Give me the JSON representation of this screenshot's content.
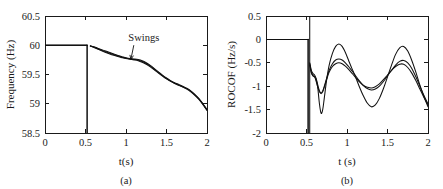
{
  "figure": {
    "background_color": "#ffffff",
    "curve_color": "#111111",
    "axis_color": "#1a1a1a",
    "panel_count": 2
  },
  "chart_data": [
    {
      "type": "line",
      "panel_id": "a",
      "caption": "(a)",
      "title": "",
      "xlabel": "t(s)",
      "ylabel": "Frequency (Hz)",
      "xlim": [
        0,
        2
      ],
      "ylim": [
        58.5,
        60.5
      ],
      "xticks": [
        0,
        0.5,
        1,
        1.5,
        2
      ],
      "xticklabels": [
        "0",
        "0.5",
        "1",
        "1.5",
        "2"
      ],
      "yticks": [
        58.5,
        59,
        59.5,
        60,
        60.5
      ],
      "yticklabels": [
        "58.5",
        "59",
        "59.5",
        "60",
        "60.5"
      ],
      "grid": false,
      "legend": false,
      "annotations": [
        {
          "text": "Swings",
          "x": 1.22,
          "y": 60.07,
          "arrow_to_x": 1.06,
          "arrow_to_y": 59.76
        }
      ],
      "event_time": 0.52,
      "series": [
        {
          "name": "frequency-curve-1",
          "x": [
            0,
            0.1,
            0.2,
            0.3,
            0.4,
            0.5,
            0.52,
            0.56,
            0.6,
            0.65,
            0.7,
            0.75,
            0.8,
            0.85,
            0.9,
            0.95,
            1.0,
            1.05,
            1.1,
            1.15,
            1.2,
            1.25,
            1.3,
            1.35,
            1.4,
            1.45,
            1.5,
            1.55,
            1.6,
            1.65,
            1.7,
            1.75,
            1.8,
            1.85,
            1.9,
            1.95,
            2.0
          ],
          "y": [
            60,
            60,
            60,
            60,
            60,
            60,
            60,
            59.99,
            59.975,
            59.95,
            59.925,
            59.9,
            59.875,
            59.85,
            59.825,
            59.805,
            59.785,
            59.772,
            59.765,
            59.755,
            59.735,
            59.7,
            59.655,
            59.6,
            59.545,
            59.49,
            59.44,
            59.395,
            59.36,
            59.33,
            59.3,
            59.265,
            59.22,
            59.16,
            59.09,
            59.0,
            58.9
          ]
        },
        {
          "name": "frequency-curve-2",
          "x": [
            0,
            0.1,
            0.2,
            0.3,
            0.4,
            0.5,
            0.52,
            0.56,
            0.6,
            0.65,
            0.7,
            0.75,
            0.8,
            0.85,
            0.9,
            0.95,
            1.0,
            1.05,
            1.1,
            1.15,
            1.2,
            1.25,
            1.3,
            1.35,
            1.4,
            1.45,
            1.5,
            1.55,
            1.6,
            1.65,
            1.7,
            1.75,
            1.8,
            1.85,
            1.9,
            1.95,
            2.0
          ],
          "y": [
            60,
            60,
            60,
            60,
            60,
            60,
            60,
            59.988,
            59.97,
            59.942,
            59.915,
            59.888,
            59.862,
            59.838,
            59.815,
            59.795,
            59.778,
            59.766,
            59.757,
            59.745,
            59.722,
            59.688,
            59.642,
            59.59,
            59.535,
            59.482,
            59.432,
            59.388,
            59.352,
            59.322,
            59.292,
            59.258,
            59.212,
            59.152,
            59.082,
            58.992,
            58.892
          ]
        },
        {
          "name": "frequency-curve-3",
          "x": [
            0,
            0.1,
            0.2,
            0.3,
            0.4,
            0.5,
            0.52,
            0.56,
            0.6,
            0.65,
            0.7,
            0.75,
            0.8,
            0.85,
            0.9,
            0.95,
            1.0,
            1.05,
            1.1,
            1.15,
            1.2,
            1.25,
            1.3,
            1.35,
            1.4,
            1.45,
            1.5,
            1.55,
            1.6,
            1.65,
            1.7,
            1.75,
            1.8,
            1.85,
            1.9,
            1.95,
            2.0
          ],
          "y": [
            60,
            60,
            60,
            60,
            60,
            60,
            60,
            59.986,
            59.965,
            59.935,
            59.906,
            59.878,
            59.852,
            59.828,
            59.806,
            59.788,
            59.772,
            59.761,
            59.75,
            59.736,
            59.711,
            59.676,
            59.63,
            59.58,
            59.526,
            59.474,
            59.425,
            59.382,
            59.345,
            59.314,
            59.284,
            59.25,
            59.204,
            59.144,
            59.074,
            58.985,
            58.885
          ]
        }
      ]
    },
    {
      "type": "line",
      "panel_id": "b",
      "caption": "(b)",
      "title": "",
      "xlabel": "t (s)",
      "ylabel": "ROCOF (Hz/s)",
      "xlim": [
        0,
        2
      ],
      "ylim": [
        -2,
        0.5
      ],
      "xticks": [
        0,
        0.5,
        1,
        1.5,
        2
      ],
      "xticklabels": [
        "0",
        "0.5",
        "1",
        "1.5",
        "2"
      ],
      "yticks": [
        -2,
        -1.5,
        -1,
        -0.5,
        0,
        0.5
      ],
      "yticklabels": [
        "-2",
        "-1.5",
        "-1",
        "-0.5",
        "0",
        "0.5"
      ],
      "grid": false,
      "legend": false,
      "annotations": [],
      "event_time": 0.52,
      "series": [
        {
          "name": "rocof-curve-1",
          "x": [
            0,
            0.1,
            0.2,
            0.3,
            0.4,
            0.5,
            0.52,
            0.54,
            0.56,
            0.58,
            0.6,
            0.62,
            0.64,
            0.66,
            0.68,
            0.7,
            0.72,
            0.75,
            0.78,
            0.82,
            0.86,
            0.9,
            0.94,
            0.98,
            1.02,
            1.06,
            1.1,
            1.15,
            1.2,
            1.25,
            1.3,
            1.35,
            1.4,
            1.45,
            1.5,
            1.55,
            1.6,
            1.65,
            1.7,
            1.75,
            1.8,
            1.85,
            1.9,
            1.95,
            2.0
          ],
          "y": [
            0,
            0,
            0,
            0,
            0,
            0,
            0,
            -0.55,
            -0.72,
            -0.78,
            -0.8,
            -0.86,
            -1.05,
            -1.38,
            -1.58,
            -1.5,
            -1.25,
            -0.85,
            -0.55,
            -0.3,
            -0.15,
            -0.1,
            -0.15,
            -0.28,
            -0.45,
            -0.62,
            -0.78,
            -1.0,
            -1.2,
            -1.36,
            -1.44,
            -1.4,
            -1.26,
            -1.05,
            -0.8,
            -0.55,
            -0.32,
            -0.18,
            -0.15,
            -0.25,
            -0.45,
            -0.7,
            -0.98,
            -1.22,
            -1.44
          ]
        },
        {
          "name": "rocof-curve-2",
          "x": [
            0,
            0.1,
            0.2,
            0.3,
            0.4,
            0.5,
            0.52,
            0.54,
            0.56,
            0.58,
            0.6,
            0.62,
            0.64,
            0.66,
            0.68,
            0.7,
            0.72,
            0.75,
            0.78,
            0.82,
            0.86,
            0.9,
            0.94,
            0.98,
            1.02,
            1.06,
            1.1,
            1.15,
            1.2,
            1.25,
            1.3,
            1.35,
            1.4,
            1.45,
            1.5,
            1.55,
            1.6,
            1.65,
            1.7,
            1.75,
            1.8,
            1.85,
            1.9,
            1.95,
            2.0
          ],
          "y": [
            0,
            0,
            0,
            0,
            0,
            0,
            0,
            -0.5,
            -0.66,
            -0.73,
            -0.76,
            -0.84,
            -0.98,
            -1.1,
            -1.14,
            -1.1,
            -1.0,
            -0.82,
            -0.66,
            -0.52,
            -0.44,
            -0.42,
            -0.44,
            -0.5,
            -0.58,
            -0.67,
            -0.76,
            -0.88,
            -0.98,
            -1.05,
            -1.08,
            -1.06,
            -1.0,
            -0.9,
            -0.78,
            -0.66,
            -0.55,
            -0.47,
            -0.45,
            -0.5,
            -0.62,
            -0.8,
            -1.0,
            -1.2,
            -1.38
          ]
        },
        {
          "name": "rocof-curve-3",
          "x": [
            0,
            0.1,
            0.2,
            0.3,
            0.4,
            0.5,
            0.52,
            0.54,
            0.56,
            0.58,
            0.6,
            0.62,
            0.64,
            0.66,
            0.68,
            0.7,
            0.72,
            0.75,
            0.78,
            0.82,
            0.86,
            0.9,
            0.94,
            0.98,
            1.02,
            1.06,
            1.1,
            1.15,
            1.2,
            1.25,
            1.3,
            1.35,
            1.4,
            1.45,
            1.5,
            1.55,
            1.6,
            1.65,
            1.7,
            1.75,
            1.8,
            1.85,
            1.9,
            1.95,
            2.0
          ],
          "y": [
            0,
            0,
            0,
            0,
            0,
            0,
            0,
            -0.52,
            -0.7,
            -0.77,
            -0.8,
            -0.9,
            -1.02,
            -1.12,
            -1.16,
            -1.12,
            -1.02,
            -0.85,
            -0.7,
            -0.58,
            -0.52,
            -0.5,
            -0.52,
            -0.57,
            -0.64,
            -0.72,
            -0.8,
            -0.9,
            -0.98,
            -1.02,
            -1.04,
            -1.01,
            -0.95,
            -0.86,
            -0.76,
            -0.66,
            -0.58,
            -0.53,
            -0.53,
            -0.6,
            -0.72,
            -0.88,
            -1.06,
            -1.24,
            -1.4
          ]
        }
      ]
    }
  ]
}
